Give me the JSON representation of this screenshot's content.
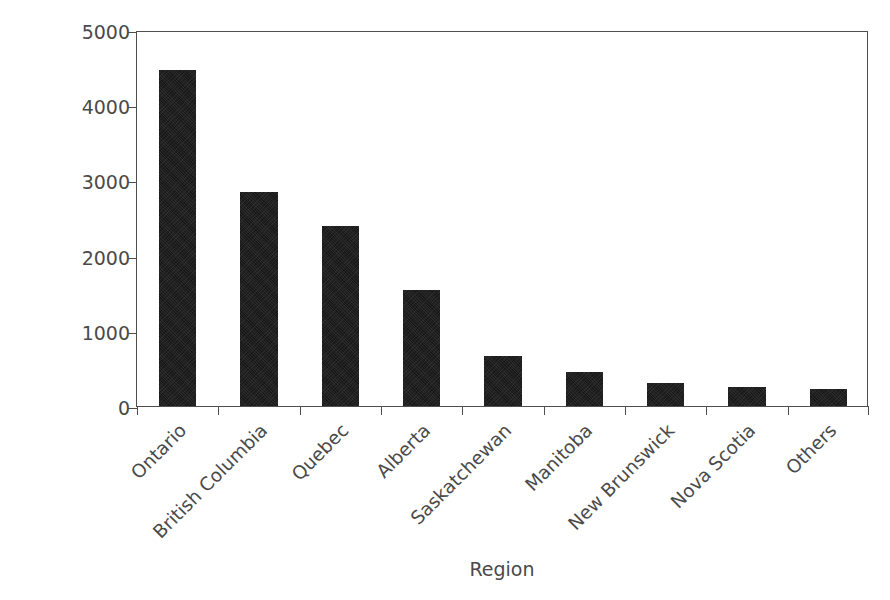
{
  "chart_data": {
    "type": "bar",
    "title": "",
    "xlabel": "Region",
    "ylabel": "Number of Cases",
    "categories": [
      "Ontario",
      "British Columbia",
      "Quebec",
      "Alberta",
      "Saskatchewan",
      "Manitoba",
      "New Brunswick",
      "Nova Scotia",
      "Others"
    ],
    "values": [
      4470,
      2850,
      2390,
      1540,
      670,
      450,
      310,
      250,
      230
    ],
    "ylim": [
      0,
      5000
    ],
    "yticks": [
      0,
      1000,
      2000,
      3000,
      4000,
      5000
    ],
    "ytick_labels": [
      "0",
      "1000",
      "2000",
      "3000",
      "4000",
      "5000"
    ],
    "grid": false,
    "legend": null,
    "bar_color": "#181818",
    "axis_color": "#4f4f4f",
    "text_color": "#4a4a4a",
    "background": "#ffffff",
    "bar_width_fraction": 0.46
  }
}
